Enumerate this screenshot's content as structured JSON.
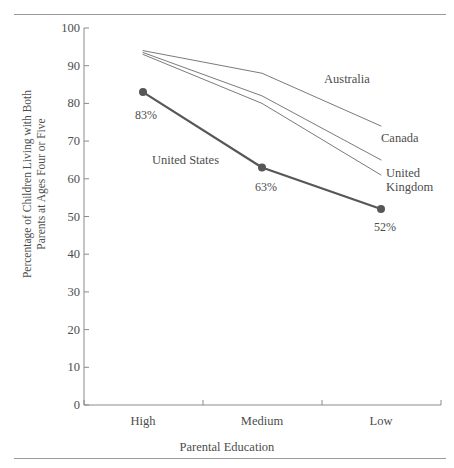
{
  "figure": {
    "clipped_header": "",
    "top_rule": "horizontal-rule",
    "bottom_rule": "horizontal-rule"
  },
  "chart_data": {
    "type": "line",
    "title": "",
    "xlabel": "Parental Education",
    "ylabel": "Percentage of Children Living with Both Parents at Ages Four or Five",
    "ylabel_line1": "Percentage of Children Living with Both",
    "ylabel_line2": "Parents at Ages Four or Five",
    "categories": [
      "High",
      "Medium",
      "Low"
    ],
    "ylim": [
      0,
      100
    ],
    "yticks": [
      0,
      10,
      20,
      30,
      40,
      50,
      60,
      70,
      80,
      90,
      100
    ],
    "grid": false,
    "legend": "inline-labels",
    "series": [
      {
        "name": "Australia",
        "values": [
          94,
          88,
          74
        ],
        "style": "thin",
        "color": "#6b6b6b",
        "markers": false,
        "label": "Australia"
      },
      {
        "name": "Canada",
        "values": [
          93.5,
          82,
          65
        ],
        "style": "thin",
        "color": "#6b6b6b",
        "markers": false,
        "label": "Canada"
      },
      {
        "name": "United Kingdom",
        "values": [
          93,
          80,
          61
        ],
        "style": "thin",
        "color": "#6b6b6b",
        "markers": false,
        "label_line1": "United",
        "label_line2": "Kingdom",
        "label": "United Kingdom"
      },
      {
        "name": "United States",
        "values": [
          83,
          63,
          52
        ],
        "style": "bold",
        "color": "#575757",
        "markers": true,
        "label": "United States",
        "data_labels": [
          "83%",
          "63%",
          "52%"
        ]
      }
    ]
  },
  "axis": {
    "ytick_labels": [
      "100",
      "90",
      "80",
      "70",
      "60",
      "50",
      "40",
      "30",
      "20",
      "10",
      "0"
    ],
    "xtick_labels": [
      "High",
      "Medium",
      "Low"
    ]
  },
  "colors": {
    "rule": "#9a9a9a",
    "axis": "#8a8a8a",
    "text": "#4d4d4d",
    "thin_line": "#6b6b6b",
    "bold_line": "#575757"
  }
}
